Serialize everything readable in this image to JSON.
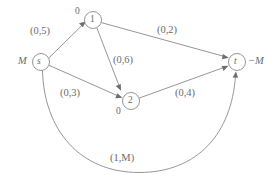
{
  "diagram": {
    "type": "directed-graph",
    "stroke_color": "#8a8a8a",
    "text_color": "#6b6b6b",
    "background": "#ffffff",
    "nodes": [
      {
        "id": "s",
        "label": "s",
        "cx": 41,
        "cy": 62,
        "r": 8.5
      },
      {
        "id": "n1",
        "label": "1",
        "cx": 93,
        "cy": 20,
        "r": 8.5
      },
      {
        "id": "n2",
        "label": "2",
        "cx": 131,
        "cy": 101,
        "r": 8.5
      },
      {
        "id": "t",
        "label": "t",
        "cx": 237,
        "cy": 62,
        "r": 8.5
      }
    ],
    "node_annotations": [
      {
        "for": "s",
        "text": "M",
        "x": 18,
        "y": 56
      },
      {
        "for": "t",
        "text": "−M",
        "x": 248,
        "y": 56
      },
      {
        "for": "n1",
        "text": "0",
        "x": 75,
        "y": 7
      },
      {
        "for": "n2",
        "text": "0",
        "x": 116,
        "y": 107
      }
    ],
    "edges": [
      {
        "id": "s-1",
        "from": "s",
        "to": "n1",
        "label": "(0,5)",
        "label_x": 30,
        "label_y": 26
      },
      {
        "id": "1-t",
        "from": "n1",
        "to": "t",
        "label": "(0,2)",
        "label_x": 157,
        "label_y": 25
      },
      {
        "id": "1-2",
        "from": "n1",
        "to": "n2",
        "label": "(0,6)",
        "label_x": 113,
        "label_y": 55
      },
      {
        "id": "s-2",
        "from": "s",
        "to": "n2",
        "label": "(0,3)",
        "label_x": 60,
        "label_y": 88
      },
      {
        "id": "2-t",
        "from": "n2",
        "to": "t",
        "label": "(0,4)",
        "label_x": 175,
        "label_y": 88
      },
      {
        "id": "s-t-arc",
        "from": "s",
        "to": "t",
        "label": "(1,M)",
        "label_x": 110,
        "label_y": 153
      }
    ]
  }
}
